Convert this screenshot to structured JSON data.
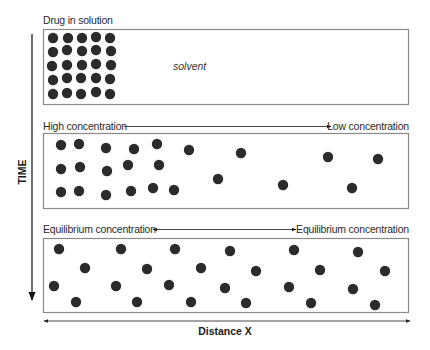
{
  "diagram": {
    "axes": {
      "time_label": "TIME",
      "distance_label": "Distance X"
    },
    "panels": [
      {
        "id": "panel-1",
        "left_label": "Drug in solution",
        "center_label": "solvent",
        "dots": [
          [
            53,
            38
          ],
          [
            68,
            38
          ],
          [
            82,
            38
          ],
          [
            96,
            37
          ],
          [
            110,
            38
          ],
          [
            53,
            52
          ],
          [
            67,
            50
          ],
          [
            82,
            51
          ],
          [
            96,
            50
          ],
          [
            111,
            51
          ],
          [
            52,
            66
          ],
          [
            67,
            65
          ],
          [
            82,
            65
          ],
          [
            96,
            64
          ],
          [
            111,
            65
          ],
          [
            53,
            80
          ],
          [
            67,
            78
          ],
          [
            81,
            78
          ],
          [
            96,
            78
          ],
          [
            110,
            79
          ],
          [
            53,
            94
          ],
          [
            67,
            93
          ],
          [
            81,
            94
          ],
          [
            96,
            92
          ],
          [
            110,
            94
          ]
        ]
      },
      {
        "id": "panel-2",
        "left_label": "High concentration",
        "right_label": "Low concentration",
        "arrow": "right",
        "dots": [
          [
            61,
            145
          ],
          [
            79,
            144
          ],
          [
            106,
            148
          ],
          [
            134,
            149
          ],
          [
            157,
            144
          ],
          [
            189,
            150
          ],
          [
            241,
            153
          ],
          [
            328,
            157
          ],
          [
            378,
            159
          ],
          [
            61,
            169
          ],
          [
            80,
            167
          ],
          [
            107,
            171
          ],
          [
            128,
            165
          ],
          [
            159,
            165
          ],
          [
            218,
            179
          ],
          [
            283,
            185
          ],
          [
            352,
            188
          ],
          [
            61,
            192
          ],
          [
            79,
            191
          ],
          [
            106,
            195
          ],
          [
            131,
            191
          ],
          [
            153,
            188
          ],
          [
            174,
            190
          ]
        ]
      },
      {
        "id": "panel-3",
        "left_label": "Equilibrium concentration",
        "right_label": "Equilibrium concentration",
        "arrow": "both",
        "dots": [
          [
            59,
            249
          ],
          [
            121,
            249
          ],
          [
            175,
            249
          ],
          [
            230,
            251
          ],
          [
            294,
            250
          ],
          [
            358,
            252
          ],
          [
            85,
            268
          ],
          [
            147,
            269
          ],
          [
            201,
            268
          ],
          [
            256,
            271
          ],
          [
            320,
            270
          ],
          [
            385,
            271
          ],
          [
            54,
            286
          ],
          [
            116,
            286
          ],
          [
            169,
            285
          ],
          [
            225,
            288
          ],
          [
            289,
            287
          ],
          [
            353,
            289
          ],
          [
            76,
            302
          ],
          [
            137,
            302
          ],
          [
            191,
            302
          ],
          [
            246,
            303
          ],
          [
            311,
            303
          ],
          [
            375,
            305
          ]
        ]
      }
    ],
    "colors": {
      "dot": "#2b2b2b",
      "box_border": "#8a8a8a",
      "text": "#2a2a2a",
      "background": "#ffffff"
    }
  }
}
